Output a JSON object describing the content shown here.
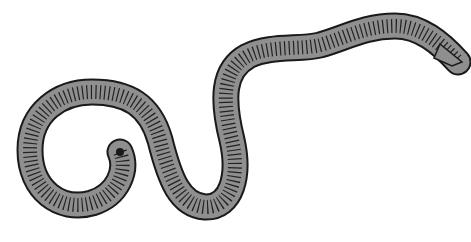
{
  "image": {
    "subject": "earthworm illustration",
    "width": 471,
    "height": 242,
    "background_color": "#ffffff",
    "body_fill_color": "#8f8f8f",
    "outline_color": "#1a1a1a",
    "segment_line_color": "#222222",
    "body_path": "M 120 152 C 128 170, 118 195, 92 203 C 60 212, 30 190, 30 150 C 30 112, 60 92, 92 92 C 128 92, 150 105, 160 140 C 170 180, 180 205, 205 207 C 232 208, 240 175, 232 140 C 222 100, 222 70, 248 56 C 270 45, 300 50, 320 45 C 345 38, 365 26, 395 26 C 420 26, 440 42, 458 62"
  }
}
